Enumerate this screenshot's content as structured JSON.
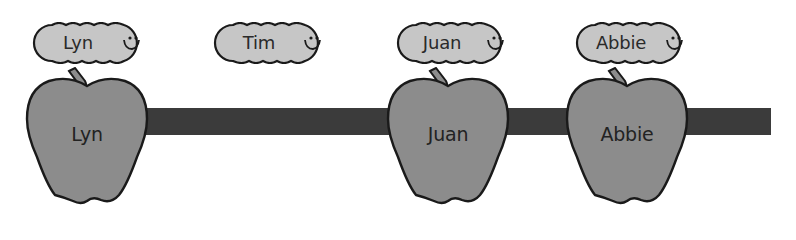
{
  "colors": {
    "background": "#ffffff",
    "apple_fill": "#8c8c8c",
    "caterpillar_fill": "#c6c6c6",
    "bar_fill": "#3b3b3b",
    "outline": "#1a1a1a"
  },
  "timeline": {
    "bar": {
      "x_start": 140,
      "x_end": 771,
      "y_top": 108,
      "y_bottom": 135
    }
  },
  "caterpillars": [
    {
      "label": "Lyn",
      "icon": "smiley-face-icon"
    },
    {
      "label": "Tim",
      "icon": "smiley-face-icon"
    },
    {
      "label": "Juan",
      "icon": "smiley-face-icon"
    },
    {
      "label": "Abbie",
      "icon": "smiley-face-icon"
    }
  ],
  "apples": [
    {
      "label": "Lyn"
    },
    {
      "label": "Juan"
    },
    {
      "label": "Abbie"
    }
  ]
}
